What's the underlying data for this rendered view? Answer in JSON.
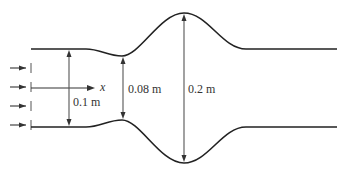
{
  "figure": {
    "type": "nozzle-duct-diagram",
    "axis_label": "x",
    "dimensions": [
      {
        "id": "inlet",
        "label": "0.1 m"
      },
      {
        "id": "throat",
        "label": "0.08 m"
      },
      {
        "id": "bulge",
        "label": "0.2 m"
      }
    ],
    "inlet_flow_arrows": 4,
    "colors": {
      "wall": "#222222",
      "dimension": "#555555",
      "text": "#333333"
    }
  }
}
